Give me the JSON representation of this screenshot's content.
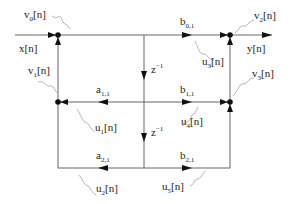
{
  "diagram": {
    "type": "lattice signal-flow graph",
    "signals": {
      "input": "x[n]",
      "output": "y[n]"
    },
    "coefficients": {
      "b01": {
        "base": "b",
        "sub": "0,1"
      },
      "a11": {
        "base": "a",
        "sub": "1,1"
      },
      "b11": {
        "base": "b",
        "sub": "1,1"
      },
      "a21": {
        "base": "a",
        "sub": "2,1"
      },
      "b21": {
        "base": "b",
        "sub": "2,1"
      }
    },
    "delays": [
      {
        "base": "z",
        "sup": "−1"
      },
      {
        "base": "z",
        "sup": "−1"
      }
    ],
    "noise_sources": {
      "v0": {
        "base": "v",
        "sub": "0",
        "suffix": "[n]"
      },
      "v1": {
        "base": "v",
        "sub": "1",
        "suffix": "[n]"
      },
      "v2": {
        "base": "v",
        "sub": "2",
        "suffix": "[n]"
      },
      "v3": {
        "base": "v",
        "sub": "3",
        "suffix": "[n]"
      },
      "u1": {
        "base": "u",
        "sub": "1",
        "suffix": "[n]"
      },
      "u2": {
        "base": "u",
        "sub": "2",
        "suffix": "[n]"
      },
      "u3": {
        "base": "u",
        "sub": "3",
        "suffix": "[n]"
      },
      "u4": {
        "base": "u",
        "sub": "4",
        "suffix": "[n]"
      },
      "u5": {
        "base": "u",
        "sub": "5",
        "suffix": "[n]"
      }
    },
    "colors": {
      "wire": "#555555",
      "arrow": "#111111",
      "squiggle": "#999999",
      "text": "#222222"
    }
  }
}
